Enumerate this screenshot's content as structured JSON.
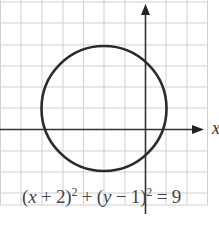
{
  "diagram": {
    "type": "circle-on-grid",
    "equation": {
      "lhs_part1": "(",
      "x_var": "x",
      "plus": " + 2)",
      "exp1": "2",
      "middle": " + (",
      "y_var": "y",
      "minus": " − 1)",
      "exp2": "2",
      "rhs": " = 9",
      "full_text": "(x + 2)^2 + (y − 1)^2 = 9"
    },
    "axis_labels": {
      "x": "x"
    },
    "circle": {
      "center": [
        -2,
        1
      ],
      "radius": 3
    },
    "grid": {
      "x_range": [
        -7,
        3
      ],
      "y_range": [
        -4,
        6
      ],
      "step": 1
    },
    "colors": {
      "grid": "#c8c8c8",
      "axis": "#333333",
      "circle": "#2a2a2a",
      "background": "#ffffff"
    }
  }
}
